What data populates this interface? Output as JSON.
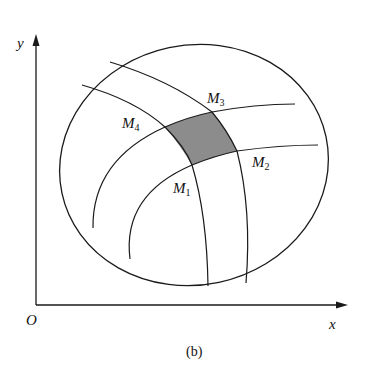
{
  "figure": {
    "caption": "(b)",
    "axes": {
      "x_label": "x",
      "y_label": "y",
      "origin_label": "O"
    },
    "points": [
      {
        "id": "M1",
        "base": "M",
        "sub": "1"
      },
      {
        "id": "M2",
        "base": "M",
        "sub": "2"
      },
      {
        "id": "M3",
        "base": "M",
        "sub": "3"
      },
      {
        "id": "M4",
        "base": "M",
        "sub": "4"
      }
    ],
    "colors": {
      "stroke": "#1a1a1a",
      "shaded_region": "#8c8c8c",
      "background": "#ffffff"
    }
  }
}
